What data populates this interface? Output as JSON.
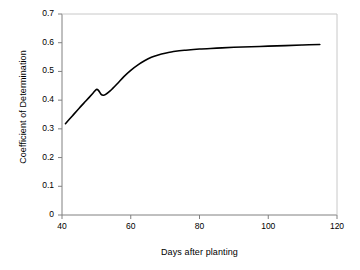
{
  "chart_data": {
    "type": "line",
    "title": "",
    "xlabel": "Days after planting",
    "ylabel": "Coefficient of Determination",
    "xlim": [
      40,
      120
    ],
    "ylim": [
      0,
      0.7
    ],
    "xticks": [
      "40",
      "60",
      "80",
      "100",
      "120"
    ],
    "xtick_values": [
      40,
      60,
      80,
      100,
      120
    ],
    "yticks": [
      "0",
      "0.1",
      "0.2",
      "0.3",
      "0.4",
      "0.5",
      "0.6",
      "0.7"
    ],
    "ytick_values": [
      0,
      0.1,
      0.2,
      0.3,
      0.4,
      0.5,
      0.6,
      0.7
    ],
    "grid": false,
    "legend": false,
    "line_color": "#000000",
    "axis_color": "#808080",
    "series": [
      {
        "name": "Coefficient of Determination",
        "x": [
          41,
          43,
          45,
          47,
          49,
          50,
          50.6,
          51.4,
          52,
          52.6,
          54,
          56,
          58,
          60,
          62,
          64,
          66,
          68,
          70,
          73,
          76,
          80,
          85,
          90,
          95,
          100,
          105,
          110,
          115
        ],
        "values": [
          0.318,
          0.345,
          0.372,
          0.398,
          0.424,
          0.437,
          0.434,
          0.42,
          0.417,
          0.419,
          0.432,
          0.456,
          0.482,
          0.504,
          0.522,
          0.537,
          0.549,
          0.557,
          0.563,
          0.57,
          0.574,
          0.578,
          0.581,
          0.584,
          0.586,
          0.588,
          0.59,
          0.592,
          0.594
        ]
      }
    ]
  }
}
